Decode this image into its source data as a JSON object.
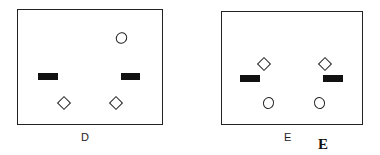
{
  "panels": [
    {
      "id": "D",
      "label": "D"
    },
    {
      "id": "E",
      "label": "E"
    }
  ],
  "caption": "E"
}
